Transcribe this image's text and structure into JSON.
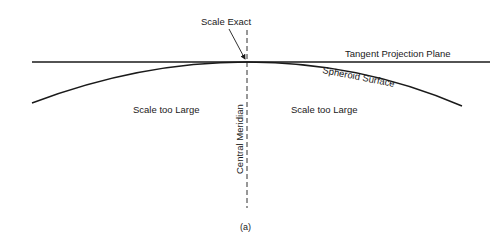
{
  "diagram": {
    "labels": {
      "scale_exact": "Scale Exact",
      "tangent_plane": "Tangent Projection Plane",
      "spheroid_surface": "Spheroid Surface",
      "scale_left": "Scale too Large",
      "scale_right": "Scale too Large",
      "central_meridian": "Central Meridian",
      "caption": "(a)"
    },
    "colors": {
      "line": "#1a1a1a",
      "background": "#ffffff"
    }
  }
}
